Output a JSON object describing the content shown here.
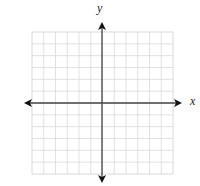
{
  "diagram": {
    "type": "coordinate-plane",
    "x_axis_label": "x",
    "y_axis_label": "y",
    "grid": {
      "left": 32,
      "top": 32,
      "right": 173,
      "bottom": 174,
      "columns": 12,
      "rows": 12,
      "line_color": "#d9d9d9",
      "border_color": "#cfcfcf"
    },
    "axes": {
      "origin_x": 102,
      "origin_y": 103,
      "x_start": 24,
      "x_end": 182,
      "y_start": 22,
      "y_end": 183,
      "color": "#444444"
    }
  }
}
